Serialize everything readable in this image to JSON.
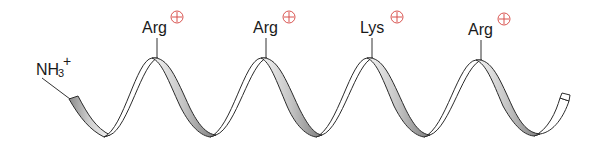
{
  "diagram": {
    "type": "alpha-helix ribbon",
    "n_terminus": {
      "label": "NH",
      "subscript": "3",
      "superscript": "+"
    },
    "residues": [
      {
        "name": "Arg",
        "charge": "+",
        "x": 157
      },
      {
        "name": "Arg",
        "charge": "+",
        "x": 266
      },
      {
        "name": "Lys",
        "charge": "+",
        "x": 372
      },
      {
        "name": "Arg",
        "charge": "+",
        "x": 481
      }
    ],
    "colors": {
      "ribbon_stroke": "#2b2b2b",
      "ribbon_shade": "#9a9a9a",
      "charge": "#d9534f",
      "text": "#1a1a1a"
    }
  }
}
